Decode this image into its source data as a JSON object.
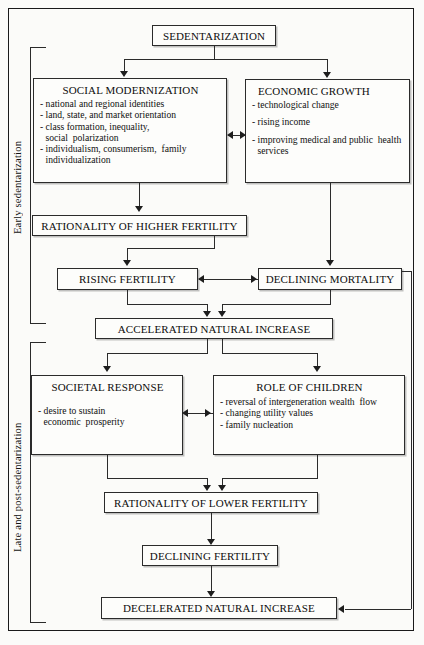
{
  "figure": {
    "type": "flowchart",
    "orientation": "top-to-bottom"
  },
  "phases": [
    {
      "id": "early",
      "label": "Early sedentarization"
    },
    {
      "id": "late",
      "label": "Late and post-sedentarization"
    }
  ],
  "nodes": {
    "sedentarization": {
      "title": "SEDENTARIZATION"
    },
    "social_modernization": {
      "title": "SOCIAL  MODERNIZATION",
      "bullets": [
        "- national and regional identities",
        "- land, state, and market orientation",
        "- class formation, inequality, social  polarization",
        "- individualism, consumerism,  family individualization"
      ]
    },
    "economic_growth": {
      "title": "ECONOMIC GROWTH",
      "bullets": [
        "- technological change",
        "- rising income",
        "- improving medical and public  health services"
      ]
    },
    "rationality_higher": {
      "title": "RATIONALITY OF HIGHER FERTILITY"
    },
    "rising_fertility": {
      "title": "RISING FERTILITY"
    },
    "declining_mortality": {
      "title": "DECLINING MORTALITY"
    },
    "accelerated_increase": {
      "title": "ACCELERATED NATURAL INCREASE"
    },
    "societal_response": {
      "title": "SOCIETAL  RESPONSE",
      "bullets": [
        "- desire to sustain economic  prosperity"
      ]
    },
    "role_of_children": {
      "title": "ROLE OF CHILDREN",
      "bullets": [
        "- reversal of intergeneration wealth  flow",
        "- changing utility values",
        "- family nucleation"
      ]
    },
    "rationality_lower": {
      "title": "RATIONALITY OF LOWER FERTILITY"
    },
    "declining_fertility": {
      "title": "DECLINING FERTILITY"
    },
    "decelerated_increase": {
      "title": "DECELERATED NATURAL INCREASE"
    }
  },
  "colors": {
    "line": "#2b2b2b",
    "text": "#0d0d0d",
    "background": "#fbfbf9",
    "box_fill": "#fdfdfb"
  }
}
